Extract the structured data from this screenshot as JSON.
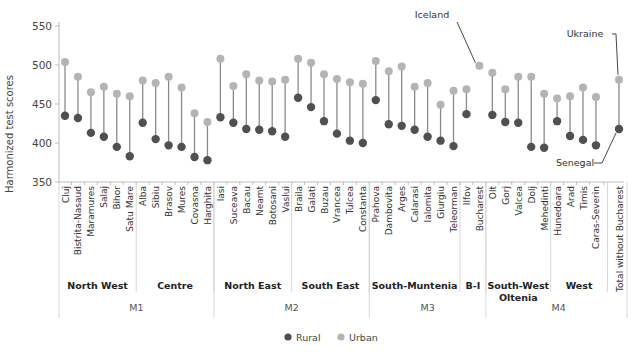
{
  "chart_data": {
    "type": "dumbbell",
    "title": "",
    "ylabel": "Harmonized test scores",
    "xlabel": "",
    "ylim": [
      350,
      550
    ],
    "yticks": [
      350,
      400,
      450,
      500,
      550
    ],
    "grid": false,
    "legend": {
      "placement": "bottom-center",
      "entries": [
        {
          "name": "Rural",
          "color": "#505050"
        },
        {
          "name": "Urban",
          "color": "#b4b4b4"
        }
      ]
    },
    "categories": [
      "Cluj",
      "Bistrita-Nasaud",
      "Maramures",
      "Salaj",
      "Bihor",
      "Satu Mare",
      "Alba",
      "Sibiu",
      "Brasov",
      "Mures",
      "Covasna",
      "Harghita",
      "Iasi",
      "Suceava",
      "Bacau",
      "Neamt",
      "Botosani",
      "Vaslui",
      "Braila",
      "Galati",
      "Buzau",
      "Vrancea",
      "Tulcea",
      "Constanta",
      "Prahova",
      "Dambovita",
      "Arges",
      "Calarasi",
      "Ialomita",
      "Giurgiu",
      "Teleorman",
      "Ilfov",
      "Bucharest",
      "Olt",
      "Gorj",
      "Valcea",
      "Dolj",
      "Mehedinti",
      "Hunedoara",
      "Arad",
      "Timis",
      "Caras-Severin",
      "Total without Bucharest"
    ],
    "series": [
      {
        "name": "Rural",
        "values": [
          435,
          432,
          413,
          408,
          395,
          383,
          426,
          405,
          397,
          395,
          382,
          378,
          433,
          426,
          418,
          417,
          415,
          408,
          458,
          446,
          428,
          412,
          403,
          400,
          455,
          424,
          422,
          417,
          408,
          403,
          396,
          437,
          null,
          436,
          427,
          426,
          395,
          394,
          428,
          409,
          404,
          397,
          418
        ]
      },
      {
        "name": "Urban",
        "values": [
          504,
          485,
          465,
          472,
          463,
          460,
          480,
          477,
          485,
          471,
          438,
          427,
          508,
          473,
          488,
          480,
          479,
          481,
          508,
          503,
          488,
          482,
          478,
          476,
          505,
          492,
          498,
          472,
          477,
          449,
          467,
          469,
          499,
          490,
          469,
          485,
          485,
          463,
          457,
          460,
          471,
          459,
          481
        ]
      }
    ],
    "regions": [
      {
        "name": "North West",
        "lines": [
          "North West"
        ],
        "count": 6
      },
      {
        "name": "Centre",
        "lines": [
          "Centre"
        ],
        "count": 6
      },
      {
        "name": "North East",
        "lines": [
          "North East"
        ],
        "count": 6
      },
      {
        "name": "South East",
        "lines": [
          "South East"
        ],
        "count": 6
      },
      {
        "name": "South-Muntenia",
        "lines": [
          "South-Muntenia"
        ],
        "count": 7
      },
      {
        "name": "B-I",
        "lines": [
          "B-I"
        ],
        "count": 2
      },
      {
        "name": "South-West Oltenia",
        "lines": [
          "South-West",
          "Oltenia"
        ],
        "count": 5
      },
      {
        "name": "West",
        "lines": [
          "West"
        ],
        "count": 4
      }
    ],
    "macroregions": [
      {
        "name": "M1",
        "count": 12
      },
      {
        "name": "M2",
        "count": 12
      },
      {
        "name": "M3",
        "count": 9
      },
      {
        "name": "M4",
        "count": 9
      }
    ],
    "annotations": [
      {
        "text": "Iceland",
        "category": "Bucharest",
        "value": 499
      },
      {
        "text": "Ukraine",
        "category": "Total without Bucharest",
        "value": 481
      },
      {
        "text": "Senegal",
        "category": "Total without Bucharest",
        "value": 418
      }
    ]
  }
}
